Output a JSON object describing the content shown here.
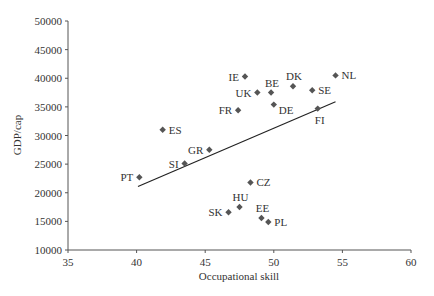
{
  "chart_data": {
    "type": "scatter",
    "title": "",
    "xlabel": "Occupational skill",
    "ylabel": "GDP/cap",
    "xlim": [
      35,
      60
    ],
    "ylim": [
      10000,
      50000
    ],
    "xticks": [
      35,
      40,
      45,
      50,
      55,
      60
    ],
    "yticks": [
      10000,
      15000,
      20000,
      25000,
      30000,
      35000,
      40000,
      45000,
      50000
    ],
    "grid": false,
    "legend": null,
    "marker": "diamond",
    "marker_color": "#555555",
    "points": [
      {
        "label": "PT",
        "x": 40.2,
        "y": 22700,
        "label_pos": "left"
      },
      {
        "label": "ES",
        "x": 41.9,
        "y": 31000,
        "label_pos": "right"
      },
      {
        "label": "SI",
        "x": 43.5,
        "y": 25100,
        "label_pos": "left"
      },
      {
        "label": "GR",
        "x": 45.3,
        "y": 27500,
        "label_pos": "left"
      },
      {
        "label": "FR",
        "x": 47.4,
        "y": 34400,
        "label_pos": "left"
      },
      {
        "label": "IE",
        "x": 47.9,
        "y": 40300,
        "label_pos": "left"
      },
      {
        "label": "UK",
        "x": 48.8,
        "y": 37500,
        "label_pos": "left"
      },
      {
        "label": "BE",
        "x": 49.8,
        "y": 37500,
        "label_pos": "above"
      },
      {
        "label": "DE",
        "x": 50.0,
        "y": 35400,
        "label_pos": "right-below"
      },
      {
        "label": "DK",
        "x": 51.4,
        "y": 38600,
        "label_pos": "above"
      },
      {
        "label": "SE",
        "x": 52.8,
        "y": 37900,
        "label_pos": "right"
      },
      {
        "label": "NL",
        "x": 54.5,
        "y": 40500,
        "label_pos": "right"
      },
      {
        "label": "FI",
        "x": 53.2,
        "y": 34700,
        "label_pos": "below"
      },
      {
        "label": "CZ",
        "x": 48.3,
        "y": 21800,
        "label_pos": "right"
      },
      {
        "label": "HU",
        "x": 47.5,
        "y": 17500,
        "label_pos": "above"
      },
      {
        "label": "SK",
        "x": 46.7,
        "y": 16600,
        "label_pos": "left"
      },
      {
        "label": "EE",
        "x": 49.1,
        "y": 15600,
        "label_pos": "above"
      },
      {
        "label": "PL",
        "x": 49.6,
        "y": 14900,
        "label_pos": "right"
      }
    ],
    "trendline": {
      "x": [
        40.1,
        54.5
      ],
      "y": [
        21100,
        35900
      ]
    }
  }
}
